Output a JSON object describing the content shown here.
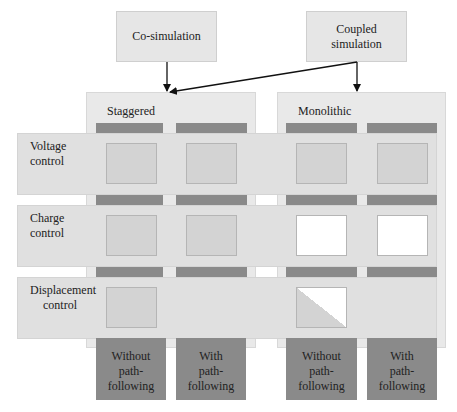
{
  "top_boxes": {
    "cosim": "Co-simulation",
    "coupled_line1": "Coupled",
    "coupled_line2": "simulation"
  },
  "panels": {
    "staggered": "Staggered",
    "monolithic": "Monolithic"
  },
  "rows": [
    {
      "line1": "Voltage",
      "line2": "control",
      "cells": [
        "filled",
        "filled",
        "filled",
        "filled"
      ]
    },
    {
      "line1": "Charge",
      "line2": "control",
      "cells": [
        "filled",
        "filled",
        "empty",
        "empty"
      ]
    },
    {
      "line1": "Displacement",
      "line2": "control",
      "cells": [
        "filled",
        "none",
        "half",
        "none"
      ]
    }
  ],
  "columns": [
    {
      "line1": "Without",
      "line2": "path-following"
    },
    {
      "line1": "With",
      "line2": "path-following"
    },
    {
      "line1": "Without",
      "line2": "path-following"
    },
    {
      "line1": "With",
      "line2": "path-following"
    }
  ],
  "colors": {
    "dark_bar": "#8a8a8a",
    "cell_filled": "#d3d3d3",
    "cell_empty": "#ffffff",
    "panel_bg": "#e9e9e9",
    "row_band": "#e0e0e0"
  }
}
